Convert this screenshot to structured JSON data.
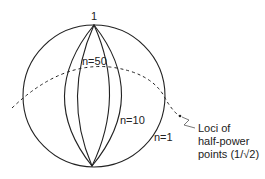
{
  "diagram": {
    "top_label": "1",
    "curves": [
      {
        "label": "n=50"
      },
      {
        "label": "n=10"
      },
      {
        "label": "n=1"
      }
    ],
    "annotation": {
      "line1": "Loci  of",
      "line2": "half-power",
      "line3": "points  (1/√2)"
    },
    "colors": {
      "stroke": "#222222",
      "background": "#ffffff"
    }
  }
}
